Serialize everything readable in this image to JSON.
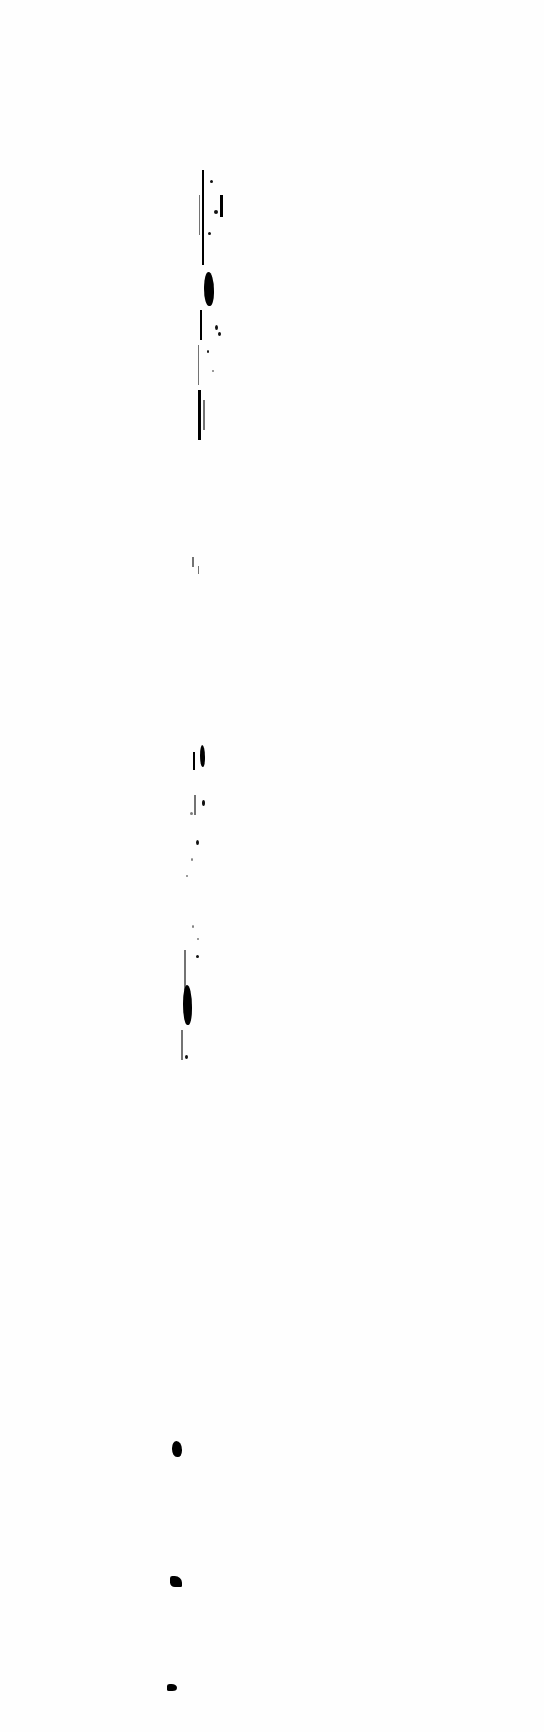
{
  "page": {
    "background": "#fefefe",
    "ink_color": "#000000"
  },
  "clusters": [
    {
      "name": "upper-streak",
      "x": 180,
      "y": 150,
      "width": 50,
      "height": 290
    },
    {
      "name": "small-mark",
      "x": 190,
      "y": 552,
      "width": 14,
      "height": 24
    },
    {
      "name": "middle-streak",
      "x": 180,
      "y": 735,
      "width": 30,
      "height": 150
    },
    {
      "name": "lower-streak",
      "x": 175,
      "y": 905,
      "width": 35,
      "height": 160
    }
  ],
  "blobs": [
    {
      "name": "blob-1",
      "x": 172,
      "y": 1440,
      "width": 12,
      "height": 16
    },
    {
      "name": "blob-2",
      "x": 170,
      "y": 1575,
      "width": 13,
      "height": 12
    },
    {
      "name": "blob-3",
      "x": 166,
      "y": 1683,
      "width": 12,
      "height": 8
    }
  ]
}
